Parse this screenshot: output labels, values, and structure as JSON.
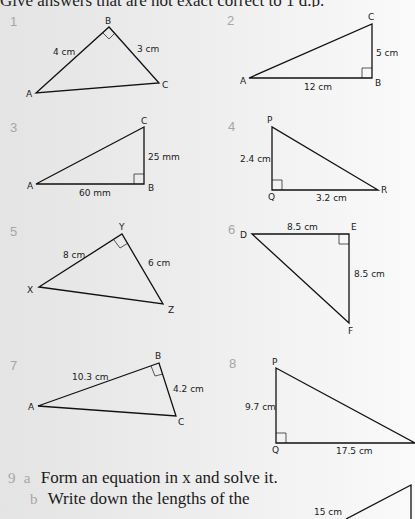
{
  "header": {
    "instruction": "Give answers that are not exact correct to 1 d.p."
  },
  "questions": [
    {
      "number": "1",
      "vertices": [
        "A",
        "B",
        "C"
      ],
      "sides": [
        "4 cm",
        "3 cm"
      ],
      "right_angle_at": "B"
    },
    {
      "number": "2",
      "vertices": [
        "A",
        "B",
        "C"
      ],
      "sides": [
        "12 cm",
        "5 cm"
      ],
      "right_angle_at": "B"
    },
    {
      "number": "3",
      "vertices": [
        "A",
        "B",
        "C"
      ],
      "sides": [
        "60 mm",
        "25 mm"
      ],
      "right_angle_at": "B"
    },
    {
      "number": "4",
      "vertices": [
        "P",
        "Q",
        "R"
      ],
      "sides": [
        "2.4 cm",
        "3.2 cm"
      ],
      "right_angle_at": "Q"
    },
    {
      "number": "5",
      "vertices": [
        "X",
        "Y",
        "Z"
      ],
      "sides": [
        "8 cm",
        "6 cm"
      ],
      "right_angle_at": "Y"
    },
    {
      "number": "6",
      "vertices": [
        "D",
        "E",
        "F"
      ],
      "sides": [
        "8.5 cm",
        "8.5 cm"
      ],
      "right_angle_at": "E"
    },
    {
      "number": "7",
      "vertices": [
        "A",
        "B",
        "C"
      ],
      "sides": [
        "10.3 cm",
        "4.2 cm"
      ],
      "right_angle_at": "B"
    },
    {
      "number": "8",
      "vertices": [
        "P",
        "Q",
        "R"
      ],
      "sides": [
        "9.7 cm",
        "17.5 cm"
      ],
      "right_angle_at": "Q"
    }
  ],
  "question9": {
    "number": "9",
    "part_a_label": "a",
    "part_a_text": "Form an equation in x and solve it.",
    "part_b_label": "b",
    "part_b_text": "Write down the lengths of the",
    "figure_label": "15 cm"
  }
}
